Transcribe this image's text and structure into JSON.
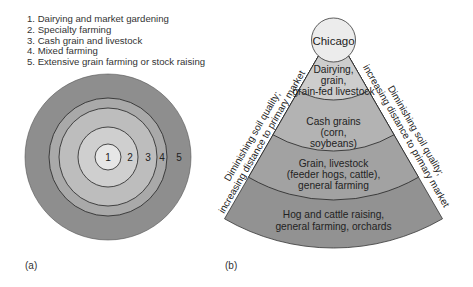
{
  "panel_a": {
    "label": "(a)",
    "legend": [
      "1. Dairying and market gardening",
      "2. Specialty farming",
      "3. Cash grain and livestock",
      "4. Mixed farming",
      "5. Extensive grain farming or stock raising"
    ],
    "rings": [
      {
        "number": "1",
        "color": "#e6e6e6"
      },
      {
        "number": "2",
        "color": "#cfcfcf"
      },
      {
        "number": "3",
        "color": "#bdbdbd"
      },
      {
        "number": "4",
        "color": "#a9a9a9"
      },
      {
        "number": "5",
        "color": "#8e8e8e"
      }
    ]
  },
  "panel_b": {
    "label": "(b)",
    "center_label": "Chicago",
    "side_label_line1": "Diminishing soil quality;",
    "side_label_line2": "increasing distance to primary market",
    "bands": [
      {
        "lines": [
          "Dairying,",
          "grain,",
          "grain-fed livestock"
        ],
        "color": "#cdcdcd"
      },
      {
        "lines": [
          "Cash grains",
          "(corn,",
          "soybeans)"
        ],
        "color": "#b3b3b3"
      },
      {
        "lines": [
          "Grain, livestock",
          "(feeder hogs, cattle),",
          "general farming"
        ],
        "color": "#a2a2a2"
      },
      {
        "lines": [
          "Hog and cattle raising,",
          "general farming, orchards"
        ],
        "color": "#929292"
      }
    ]
  }
}
